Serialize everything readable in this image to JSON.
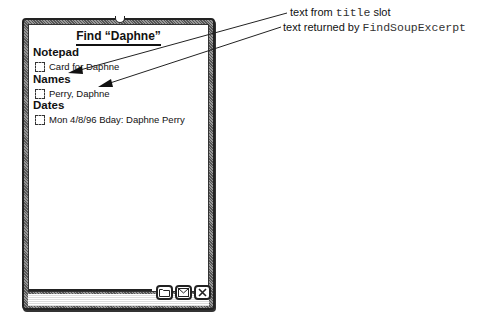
{
  "window": {
    "title": "Find “Daphne”",
    "sections": [
      {
        "header": "Notepad",
        "items": [
          {
            "label": "Card for Daphne",
            "checked": false
          }
        ]
      },
      {
        "header": "Names",
        "items": [
          {
            "label": "Perry, Daphne",
            "checked": false
          }
        ]
      },
      {
        "header": "Dates",
        "items": [
          {
            "label": "Mon 4/8/96 Bday: Daphne Perry",
            "checked": false
          }
        ]
      }
    ],
    "buttons": [
      {
        "icon": "folder-icon"
      },
      {
        "icon": "routing-envelope-icon"
      },
      {
        "icon": "close-icon"
      }
    ]
  },
  "callouts": [
    {
      "prefix": "text from ",
      "code": "title",
      "suffix": " slot"
    },
    {
      "prefix": "text returned by ",
      "code": "FindSoupExcerpt",
      "suffix": ""
    }
  ]
}
